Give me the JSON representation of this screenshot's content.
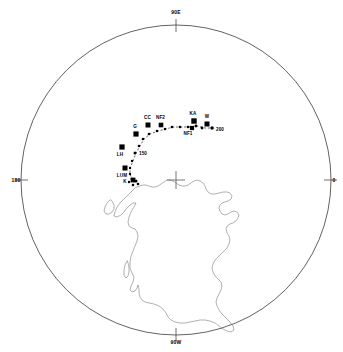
{
  "figure": {
    "type": "polar-projection-map",
    "background_color": "#ffffff",
    "line_color": "#3a3a3a",
    "marker_color": "#000000",
    "projection": {
      "center_x": 176,
      "center_y": 180,
      "radius": 155
    }
  },
  "axis_labels": [
    {
      "name": "top",
      "text": "90E",
      "x": 176,
      "y": 12
    },
    {
      "name": "right",
      "text": "0",
      "x": 334,
      "y": 180
    },
    {
      "name": "bottom",
      "text": "90W",
      "x": 176,
      "y": 342
    },
    {
      "name": "left",
      "text": "180",
      "x": 16,
      "y": 180
    }
  ],
  "center_marker": {
    "name": "north-pole-cross",
    "x": 176,
    "y": 180,
    "size": 9
  },
  "chart_data": {
    "type": "scatter",
    "title": "",
    "xlabel": "",
    "ylabel": "",
    "grid": false,
    "legend": false,
    "projection": "polar stereographic, north polar, longitude 0 at right, 90E at top, 180 at left, 90W at bottom",
    "series": [
      {
        "name": "Paleomagnetic poles (large squares)",
        "marker": "filled-square",
        "points": [
          {
            "label": "CC",
            "x": 148,
            "y": 125,
            "size": 5.0,
            "label_dx": -0.5,
            "label_dy": -7
          },
          {
            "label": "NF2",
            "x": 161,
            "y": 125,
            "size": 4.6,
            "label_dx": -0.5,
            "label_dy": -7
          },
          {
            "label": "KA",
            "x": 194,
            "y": 121,
            "size": 5.4,
            "label_dx": -1,
            "label_dy": -7
          },
          {
            "label": "W",
            "x": 207,
            "y": 124,
            "size": 5.0,
            "label_dx": 0,
            "label_dy": -7
          },
          {
            "label": "NF1",
            "x": 192,
            "y": 128,
            "size": 4.2,
            "label_dx": -4,
            "label_dy": 6
          },
          {
            "label": "G",
            "x": 136,
            "y": 134,
            "size": 5.2,
            "label_dx": -1,
            "label_dy": -7
          },
          {
            "label": "LH",
            "x": 122,
            "y": 147,
            "size": 5.2,
            "label_dx": -2,
            "label_dy": 7.5
          },
          {
            "label": "LUM",
            "x": 125,
            "y": 168,
            "size": 5.0,
            "label_dx": -3,
            "label_dy": 7.5
          },
          {
            "label": "K",
            "x": 133,
            "y": 180,
            "size": 4.8,
            "label_dx": -8,
            "label_dy": 2
          }
        ]
      },
      {
        "name": "Path nodes (small dots)",
        "marker": "filled-circle",
        "points": [
          {
            "x": 212,
            "y": 128,
            "size": 3.4
          },
          {
            "x": 202,
            "y": 128,
            "size": 2.8
          },
          {
            "x": 196,
            "y": 126,
            "size": 2.8
          },
          {
            "x": 188,
            "y": 127,
            "size": 2.6
          },
          {
            "x": 180,
            "y": 127,
            "size": 2.6
          },
          {
            "x": 172,
            "y": 127,
            "size": 2.6
          },
          {
            "x": 165,
            "y": 129,
            "size": 2.6
          },
          {
            "x": 157,
            "y": 131,
            "size": 2.6
          },
          {
            "x": 149,
            "y": 134,
            "size": 2.6
          },
          {
            "x": 143,
            "y": 139,
            "size": 2.6
          },
          {
            "x": 139,
            "y": 146,
            "size": 2.6
          },
          {
            "x": 135,
            "y": 153,
            "size": 3.0
          },
          {
            "x": 132,
            "y": 161,
            "size": 2.4
          },
          {
            "x": 130,
            "y": 168,
            "size": 2.4
          },
          {
            "x": 130,
            "y": 174,
            "size": 2.4
          },
          {
            "x": 132,
            "y": 179,
            "size": 2.6
          },
          {
            "x": 136,
            "y": 181,
            "size": 3.0
          },
          {
            "x": 138,
            "y": 184,
            "size": 2.6
          },
          {
            "x": 133,
            "y": 185,
            "size": 2.6
          },
          {
            "x": 129,
            "y": 182,
            "size": 2.4
          }
        ]
      }
    ],
    "age_annotations": [
      {
        "text": "200",
        "x": 216,
        "y": 130,
        "anchor": "left"
      },
      {
        "text": "150",
        "x": 139,
        "y": 154,
        "anchor": "left"
      }
    ],
    "pole_labels": [
      "CC",
      "NF2",
      "KA",
      "W",
      "NF1",
      "G",
      "LH",
      "LUM",
      "K"
    ],
    "annotation_note": ""
  },
  "map": {
    "name": "north-america-coastline",
    "stroke": "#707070",
    "stroke_width": 0.55
  }
}
